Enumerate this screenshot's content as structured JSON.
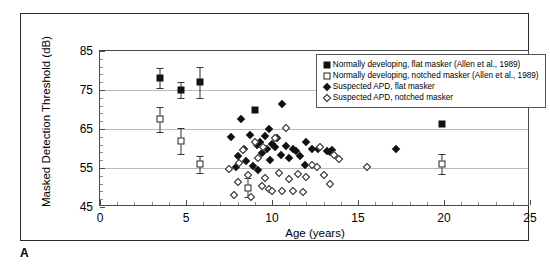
{
  "panel": {
    "label": "A"
  },
  "chart_data": {
    "type": "scatter",
    "title": "",
    "xlabel": "Age (years)",
    "ylabel": "Masked Detection Threshold (dB)",
    "xlim": [
      0,
      25
    ],
    "ylim": [
      45,
      85
    ],
    "xticks": [
      0,
      5,
      10,
      15,
      20,
      25
    ],
    "yticks": [
      45,
      55,
      65,
      75,
      85
    ],
    "grid": "horizontal gridlines at 55, 65, 75",
    "legend_position": "top-right inside plot",
    "series": [
      {
        "name": "Normally developing, flat masker (Allen et al., 1989)",
        "marker": "filled-square",
        "points": [
          {
            "x": 3.5,
            "y": 78.0,
            "err": 2.6
          },
          {
            "x": 4.7,
            "y": 75.0,
            "err": 2.0
          },
          {
            "x": 5.8,
            "y": 77.0,
            "err": 4.0
          },
          {
            "x": 9.0,
            "y": 70.0
          },
          {
            "x": 19.9,
            "y": 66.3
          }
        ]
      },
      {
        "name": "Normally developing, notched masker (Allen et al., 1989)",
        "marker": "open-square",
        "points": [
          {
            "x": 3.5,
            "y": 67.5,
            "err": 3.2
          },
          {
            "x": 4.7,
            "y": 62.0,
            "err": 3.3
          },
          {
            "x": 5.8,
            "y": 56.0,
            "err": 2.2
          },
          {
            "x": 8.6,
            "y": 50.0,
            "err": 2.5
          },
          {
            "x": 19.9,
            "y": 56.0,
            "err": 2.6
          }
        ]
      },
      {
        "name": "Suspected APD, flat masker",
        "marker": "filled-diamond",
        "points": [
          {
            "x": 7.6,
            "y": 63.0
          },
          {
            "x": 8.2,
            "y": 67.5
          },
          {
            "x": 8.4,
            "y": 60.0
          },
          {
            "x": 8.5,
            "y": 56.8
          },
          {
            "x": 8.7,
            "y": 63.4
          },
          {
            "x": 8.9,
            "y": 55.4
          },
          {
            "x": 9.1,
            "y": 60.8
          },
          {
            "x": 9.3,
            "y": 61.7
          },
          {
            "x": 9.4,
            "y": 58.8
          },
          {
            "x": 9.6,
            "y": 63.2
          },
          {
            "x": 9.7,
            "y": 59.9
          },
          {
            "x": 9.9,
            "y": 57.0
          },
          {
            "x": 10.0,
            "y": 61.2
          },
          {
            "x": 10.2,
            "y": 60.3
          },
          {
            "x": 10.3,
            "y": 62.8
          },
          {
            "x": 10.5,
            "y": 58.4
          },
          {
            "x": 10.6,
            "y": 71.5
          },
          {
            "x": 10.8,
            "y": 60.6
          },
          {
            "x": 11.0,
            "y": 57.5
          },
          {
            "x": 11.2,
            "y": 60.0
          },
          {
            "x": 11.4,
            "y": 59.4
          },
          {
            "x": 11.6,
            "y": 58.2
          },
          {
            "x": 12.0,
            "y": 61.7
          },
          {
            "x": 12.3,
            "y": 60.0
          },
          {
            "x": 12.7,
            "y": 60.0
          },
          {
            "x": 13.2,
            "y": 59.3
          },
          {
            "x": 13.4,
            "y": 59.0
          },
          {
            "x": 13.5,
            "y": 59.5
          },
          {
            "x": 11.9,
            "y": 55.8
          },
          {
            "x": 8.0,
            "y": 58.0
          },
          {
            "x": 9.2,
            "y": 54.6
          },
          {
            "x": 7.9,
            "y": 55.2
          },
          {
            "x": 17.2,
            "y": 60.0
          },
          {
            "x": 9.8,
            "y": 65.0
          }
        ]
      },
      {
        "name": "Suspected APD, notched masker",
        "marker": "open-diamond",
        "points": [
          {
            "x": 7.5,
            "y": 54.8
          },
          {
            "x": 7.8,
            "y": 48.0
          },
          {
            "x": 8.0,
            "y": 51.3
          },
          {
            "x": 8.3,
            "y": 59.6
          },
          {
            "x": 8.6,
            "y": 53.2
          },
          {
            "x": 8.8,
            "y": 47.6
          },
          {
            "x": 9.0,
            "y": 61.6
          },
          {
            "x": 9.2,
            "y": 57.6
          },
          {
            "x": 9.4,
            "y": 50.4
          },
          {
            "x": 9.6,
            "y": 52.4
          },
          {
            "x": 9.8,
            "y": 49.6
          },
          {
            "x": 10.0,
            "y": 49.0
          },
          {
            "x": 10.2,
            "y": 62.8
          },
          {
            "x": 10.4,
            "y": 53.6
          },
          {
            "x": 10.6,
            "y": 49.2
          },
          {
            "x": 10.8,
            "y": 65.3
          },
          {
            "x": 11.0,
            "y": 52.3
          },
          {
            "x": 11.2,
            "y": 49.0
          },
          {
            "x": 11.5,
            "y": 53.4
          },
          {
            "x": 11.8,
            "y": 48.8
          },
          {
            "x": 12.0,
            "y": 52.6
          },
          {
            "x": 12.3,
            "y": 55.7
          },
          {
            "x": 12.6,
            "y": 55.2
          },
          {
            "x": 13.0,
            "y": 53.2
          },
          {
            "x": 13.4,
            "y": 51.0
          },
          {
            "x": 13.6,
            "y": 58.4
          },
          {
            "x": 13.9,
            "y": 57.4
          },
          {
            "x": 15.5,
            "y": 55.3
          },
          {
            "x": 9.5,
            "y": 60.4
          },
          {
            "x": 8.1,
            "y": 56.4
          },
          {
            "x": 12.8,
            "y": 60.5
          }
        ]
      }
    ]
  }
}
